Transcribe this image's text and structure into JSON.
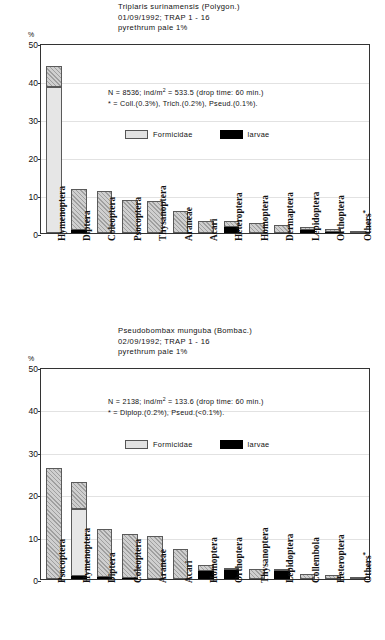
{
  "chart_data": [
    {
      "type": "bar",
      "title": "Triplaris surinamensis (Polygon.)",
      "subtitle": "01/09/1992; TRAP 1 - 16",
      "subtitle2": "pyrethrum pale 1%",
      "ylabel": "%",
      "ylim": [
        0,
        50
      ],
      "yticks": [
        0,
        10,
        20,
        30,
        40,
        50
      ],
      "grid": true,
      "annotation_line1_pre": "N = 8536; ind/m",
      "annotation_line1_sup": "2",
      "annotation_line1_post": " = 533.5 (drop time: 60 min.)",
      "annotation_line2": "* = Coll.(0.3%), Trich.(0.2%), Pseud.(0.1%).",
      "legend": [
        {
          "key": "formicidae",
          "label": "Formicidae",
          "color": "#e6e6e6"
        },
        {
          "key": "larvae",
          "label": "larvae",
          "color": "#000000"
        }
      ],
      "categories": [
        "Hymenoptera",
        "Diptera",
        "Coleoptera",
        "Psocoptera",
        "Thysanoptera",
        "Araneae",
        "Acari",
        "Heteroptera",
        "Homoptera",
        "Dermaptera",
        "Lepidoptera",
        "Orthoptera",
        "Others*"
      ],
      "series": [
        {
          "name": "other",
          "values": [
            5.5,
            10.9,
            11.0,
            8.7,
            8.5,
            5.7,
            3.2,
            1.4,
            2.6,
            2.1,
            0.8,
            0.7,
            0.3
          ]
        },
        {
          "name": "formicidae",
          "values": [
            38.5,
            0,
            0,
            0,
            0,
            0,
            0,
            0,
            0,
            0,
            0,
            0,
            0
          ]
        },
        {
          "name": "larvae",
          "values": [
            0,
            0.8,
            0,
            0,
            0,
            0,
            0,
            1.7,
            0,
            0,
            0.7,
            0.3,
            0
          ]
        }
      ],
      "totals": [
        44.0,
        11.7,
        11.0,
        8.7,
        8.5,
        5.7,
        3.2,
        3.1,
        2.6,
        2.1,
        1.5,
        1.0,
        0.3
      ]
    },
    {
      "type": "bar",
      "title": "Pseudobombax munguba (Bombac.)",
      "subtitle": "02/09/1992; TRAP 1 - 16",
      "subtitle2": "pyrethrum pale 1%",
      "ylabel": "%",
      "ylim": [
        0,
        50
      ],
      "yticks": [
        0,
        10,
        20,
        30,
        40,
        50
      ],
      "grid": true,
      "annotation_line1_pre": "N = 2138; ind/m",
      "annotation_line1_sup": "2",
      "annotation_line1_post": " = 133.6 (drop time: 60 min.)",
      "annotation_line2": "* = Diplop.(0.2%), Pseud.(<0.1%).",
      "legend": [
        {
          "key": "formicidae",
          "label": "Formicidae",
          "color": "#e6e6e6"
        },
        {
          "key": "larvae",
          "label": "larvae",
          "color": "#000000"
        }
      ],
      "categories": [
        "Psocoptera",
        "Hymenoptera",
        "Diptera",
        "Coleoptera",
        "Araneae",
        "Acari",
        "Homoptera",
        "Orthoptera",
        "Thysanoptera",
        "Lepidoptera",
        "Collembola",
        "Heteroptera",
        "Others*"
      ],
      "series": [
        {
          "name": "other",
          "values": [
            26.1,
            6.3,
            11.3,
            10.4,
            10.2,
            7.0,
            1.3,
            0.5,
            2.3,
            0.4,
            1.3,
            1.0,
            0.3
          ]
        },
        {
          "name": "formicidae",
          "values": [
            0,
            15.9,
            0,
            0,
            0,
            0,
            0,
            0,
            0,
            0,
            0,
            0,
            0
          ]
        },
        {
          "name": "larvae",
          "values": [
            0,
            0.6,
            0.5,
            0.2,
            0,
            0,
            2.0,
            2.2,
            0,
            1.8,
            0,
            0,
            0
          ]
        }
      ],
      "totals": [
        26.1,
        22.8,
        11.8,
        10.6,
        10.2,
        7.0,
        3.3,
        2.7,
        2.3,
        2.2,
        1.3,
        1.0,
        0.3
      ]
    }
  ]
}
